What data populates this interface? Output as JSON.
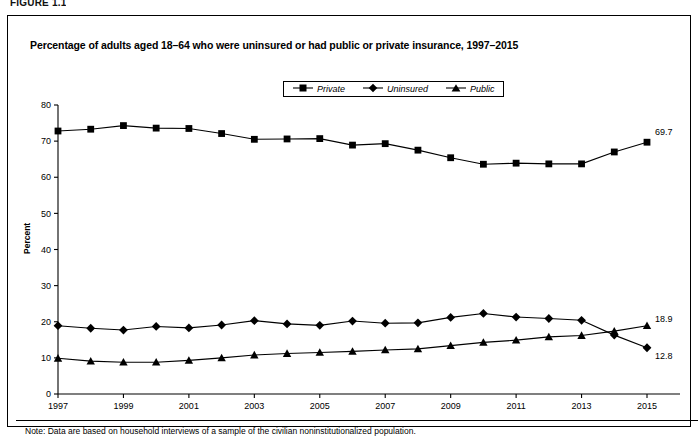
{
  "figure_label": "FIGURE 1.1",
  "title": "Percentage of adults aged 18–64 who were uninsured or had public or private insurance, 1997–2015",
  "note": "Note: Data are based on household interviews of a sample of the civilian noninstitutionalized population.",
  "ylabel": "Percent",
  "legend": {
    "items": [
      {
        "label": "Private",
        "marker": "square",
        "color": "#000000"
      },
      {
        "label": "Uninsured",
        "marker": "diamond",
        "color": "#000000"
      },
      {
        "label": "Public",
        "marker": "triangle",
        "color": "#000000"
      }
    ]
  },
  "endpoint_labels": [
    {
      "series": "Private",
      "value": "69.7"
    },
    {
      "series": "Public",
      "value": "18.9"
    },
    {
      "series": "Uninsured",
      "value": "12.8"
    }
  ],
  "chart_data": {
    "type": "line",
    "title": "Percentage of adults aged 18–64 who were uninsured or had public or private insurance, 1997–2015",
    "xlabel": "",
    "ylabel": "Percent",
    "ylim": [
      0,
      80
    ],
    "yticks": [
      0,
      10,
      20,
      30,
      40,
      50,
      60,
      70,
      80
    ],
    "ytick_labels": [
      "0",
      "10",
      "20",
      "30",
      "40",
      "50",
      "60",
      "70",
      "80"
    ],
    "xlim": [
      1997,
      2015
    ],
    "x": [
      1997,
      1998,
      1999,
      2000,
      2001,
      2002,
      2003,
      2004,
      2005,
      2006,
      2007,
      2008,
      2009,
      2010,
      2011,
      2012,
      2013,
      2014,
      2015
    ],
    "xticks": [
      1997,
      1999,
      2001,
      2003,
      2005,
      2007,
      2009,
      2011,
      2013,
      2015
    ],
    "xtick_labels": [
      "1997",
      "1999",
      "2001",
      "2003",
      "2005",
      "2007",
      "2009",
      "2011",
      "2013",
      "2015"
    ],
    "grid": false,
    "legend_position": "top-center",
    "series": [
      {
        "name": "Private",
        "marker": "square",
        "color": "#000000",
        "values": [
          72.8,
          73.3,
          74.3,
          73.6,
          73.5,
          72.1,
          70.5,
          70.6,
          70.7,
          68.9,
          69.3,
          67.5,
          65.4,
          63.6,
          63.9,
          63.7,
          63.7,
          67.0,
          69.7
        ]
      },
      {
        "name": "Uninsured",
        "marker": "diamond",
        "color": "#000000",
        "values": [
          18.9,
          18.2,
          17.7,
          18.7,
          18.3,
          19.1,
          20.3,
          19.4,
          19.0,
          20.2,
          19.6,
          19.7,
          21.2,
          22.3,
          21.3,
          20.9,
          20.4,
          16.3,
          12.8
        ]
      },
      {
        "name": "Public",
        "marker": "triangle",
        "color": "#000000",
        "values": [
          9.9,
          9.1,
          8.8,
          8.8,
          9.3,
          10.0,
          10.8,
          11.2,
          11.5,
          11.8,
          12.2,
          12.5,
          13.4,
          14.3,
          14.9,
          15.8,
          16.2,
          17.4,
          18.9
        ]
      }
    ]
  }
}
